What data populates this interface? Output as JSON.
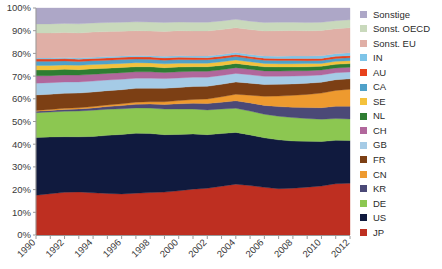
{
  "chart_data": {
    "type": "area",
    "stacked": true,
    "normalized": true,
    "title": "",
    "xlabel": "",
    "ylabel": "",
    "grid": false,
    "legend_position": "right",
    "ylim": [
      0,
      100
    ],
    "ytick_labels": [
      "0%",
      "10%",
      "20%",
      "30%",
      "40%",
      "50%",
      "60%",
      "70%",
      "80%",
      "90%",
      "100%"
    ],
    "ytick_values": [
      0,
      10,
      20,
      30,
      40,
      50,
      60,
      70,
      80,
      90,
      100
    ],
    "x": [
      1990,
      1991,
      1992,
      1993,
      1994,
      1995,
      1996,
      1997,
      1998,
      1999,
      2000,
      2001,
      2002,
      2003,
      2004,
      2005,
      2006,
      2007,
      2008,
      2009,
      2010,
      2011,
      2012
    ],
    "xtick_labels": [
      "1990",
      "1992",
      "1994",
      "1996",
      "1998",
      "2000",
      "2002",
      "2004",
      "2006",
      "2008",
      "2010",
      "2012"
    ],
    "xtick_values": [
      1990,
      1992,
      1994,
      1996,
      1998,
      2000,
      2002,
      2004,
      2006,
      2008,
      2010,
      2012
    ],
    "series": [
      {
        "name": "JP",
        "color": "#BE2F21",
        "values": [
          17.5,
          18.2,
          18.8,
          19.0,
          18.6,
          18.3,
          18.1,
          18.4,
          18.7,
          18.9,
          19.5,
          20.2,
          20.6,
          21.5,
          22.4,
          21.8,
          21.0,
          20.2,
          20.4,
          21.0,
          21.6,
          22.6,
          22.8
        ]
      },
      {
        "name": "US",
        "color": "#101A3E",
        "values": [
          25.4,
          25.0,
          24.5,
          24.3,
          24.8,
          25.6,
          26.2,
          26.4,
          26.0,
          25.3,
          24.8,
          24.3,
          23.6,
          23.2,
          22.8,
          22.3,
          21.8,
          21.3,
          20.6,
          20.1,
          19.6,
          19.1,
          18.8
        ]
      },
      {
        "name": "DE",
        "color": "#8CC751",
        "values": [
          11.0,
          11.0,
          11.2,
          11.4,
          11.6,
          11.5,
          11.3,
          11.2,
          11.2,
          11.3,
          11.2,
          11.0,
          10.9,
          10.8,
          10.6,
          10.5,
          10.4,
          10.3,
          10.2,
          10.0,
          9.8,
          9.6,
          9.5
        ]
      },
      {
        "name": "KR",
        "color": "#4B4977",
        "values": [
          0.6,
          0.7,
          0.8,
          0.9,
          1.0,
          1.2,
          1.4,
          1.6,
          1.8,
          2.0,
          2.3,
          2.5,
          2.8,
          3.0,
          3.3,
          3.6,
          3.9,
          4.2,
          4.5,
          4.8,
          5.1,
          5.4,
          5.6
        ]
      },
      {
        "name": "CN",
        "color": "#EE9A2F",
        "values": [
          0.4,
          0.4,
          0.5,
          0.5,
          0.6,
          0.7,
          0.8,
          0.9,
          1.0,
          1.2,
          1.4,
          1.7,
          2.0,
          2.4,
          2.9,
          3.4,
          4.0,
          4.6,
          5.2,
          5.8,
          6.4,
          7.0,
          7.5
        ]
      },
      {
        "name": "FR",
        "color": "#7C3F14",
        "values": [
          6.8,
          6.7,
          6.6,
          6.5,
          6.4,
          6.3,
          6.2,
          6.1,
          6.0,
          5.9,
          5.8,
          5.7,
          5.6,
          5.5,
          5.4,
          5.3,
          5.2,
          5.1,
          5.0,
          4.9,
          4.8,
          4.7,
          4.6
        ]
      },
      {
        "name": "GB",
        "color": "#A5CBE6",
        "values": [
          5.2,
          5.1,
          5.0,
          4.9,
          4.8,
          4.7,
          4.6,
          4.5,
          4.4,
          4.3,
          4.2,
          4.1,
          4.0,
          3.9,
          3.8,
          3.7,
          3.6,
          3.5,
          3.4,
          3.3,
          3.2,
          3.1,
          3.0
        ]
      },
      {
        "name": "CH",
        "color": "#B1679C",
        "values": [
          3.2,
          3.1,
          3.1,
          3.0,
          3.0,
          2.9,
          2.9,
          2.8,
          2.8,
          2.7,
          2.7,
          2.6,
          2.6,
          2.5,
          2.5,
          2.4,
          2.4,
          2.3,
          2.3,
          2.2,
          2.2,
          2.1,
          2.1
        ]
      },
      {
        "name": "NL",
        "color": "#2E7D32",
        "values": [
          2.6,
          2.5,
          2.5,
          2.4,
          2.4,
          2.3,
          2.3,
          2.2,
          2.2,
          2.1,
          2.1,
          2.0,
          2.0,
          1.9,
          1.9,
          1.8,
          1.8,
          1.8,
          1.7,
          1.7,
          1.6,
          1.6,
          1.6
        ]
      },
      {
        "name": "SE",
        "color": "#F4C23C",
        "values": [
          2.0,
          2.0,
          1.9,
          1.9,
          1.9,
          1.8,
          1.8,
          1.8,
          1.7,
          1.7,
          1.7,
          1.6,
          1.6,
          1.6,
          1.5,
          1.5,
          1.5,
          1.4,
          1.4,
          1.4,
          1.3,
          1.3,
          1.3
        ]
      },
      {
        "name": "CA",
        "color": "#4FA1C9",
        "values": [
          1.8,
          1.8,
          1.8,
          1.7,
          1.7,
          1.7,
          1.7,
          1.6,
          1.6,
          1.6,
          1.6,
          1.5,
          1.5,
          1.5,
          1.5,
          1.4,
          1.4,
          1.4,
          1.4,
          1.3,
          1.3,
          1.3,
          1.3
        ]
      },
      {
        "name": "AU",
        "color": "#E8411C",
        "values": [
          1.0,
          1.0,
          1.0,
          1.0,
          1.0,
          1.0,
          1.0,
          1.0,
          1.0,
          1.0,
          1.0,
          1.0,
          0.9,
          0.9,
          0.9,
          0.9,
          0.9,
          0.9,
          0.9,
          0.9,
          0.9,
          0.9,
          0.9
        ]
      },
      {
        "name": "IN",
        "color": "#7EC4E8",
        "values": [
          0.5,
          0.5,
          0.5,
          0.5,
          0.5,
          0.6,
          0.6,
          0.6,
          0.6,
          0.7,
          0.7,
          0.7,
          0.8,
          0.8,
          0.9,
          0.9,
          1.0,
          1.0,
          1.1,
          1.1,
          1.2,
          1.2,
          1.3
        ]
      },
      {
        "name": "Sonst. EU",
        "color": "#E0AFA6",
        "values": [
          11.0,
          11.0,
          11.0,
          11.1,
          11.1,
          11.0,
          10.9,
          10.9,
          10.9,
          11.0,
          11.0,
          11.0,
          11.0,
          11.0,
          10.9,
          11.0,
          11.0,
          11.1,
          11.1,
          11.1,
          11.1,
          11.0,
          11.0
        ]
      },
      {
        "name": "Sonst. OECD",
        "color": "#C9D9BC",
        "values": [
          4.0,
          4.0,
          4.0,
          4.0,
          4.0,
          4.0,
          3.9,
          3.9,
          3.9,
          3.9,
          3.8,
          3.8,
          3.8,
          3.8,
          3.7,
          3.7,
          3.7,
          3.7,
          3.6,
          3.6,
          3.6,
          3.5,
          3.5
        ]
      },
      {
        "name": "Sonstige",
        "color": "#ADA7C7",
        "values": [
          7.0,
          7.0,
          6.8,
          7.0,
          6.6,
          6.4,
          6.3,
          6.1,
          6.2,
          6.4,
          6.2,
          6.3,
          6.3,
          5.7,
          5.0,
          5.8,
          6.4,
          6.2,
          6.2,
          6.4,
          6.3,
          5.6,
          5.2
        ]
      }
    ]
  },
  "legend": {
    "items": [
      {
        "label": "Sonstige",
        "color": "#ADA7C7"
      },
      {
        "label": "Sonst. OECD",
        "color": "#C9D9BC"
      },
      {
        "label": "Sonst. EU",
        "color": "#E0AFA6"
      },
      {
        "label": "IN",
        "color": "#7EC4E8"
      },
      {
        "label": "AU",
        "color": "#E8411C"
      },
      {
        "label": "CA",
        "color": "#4FA1C9"
      },
      {
        "label": "SE",
        "color": "#F4C23C"
      },
      {
        "label": "NL",
        "color": "#2E7D32"
      },
      {
        "label": "CH",
        "color": "#B1679C"
      },
      {
        "label": "GB",
        "color": "#A5CBE6"
      },
      {
        "label": "FR",
        "color": "#7C3F14"
      },
      {
        "label": "CN",
        "color": "#EE9A2F"
      },
      {
        "label": "KR",
        "color": "#4B4977"
      },
      {
        "label": "DE",
        "color": "#8CC751"
      },
      {
        "label": "US",
        "color": "#101A3E"
      },
      {
        "label": "JP",
        "color": "#BE2F21"
      }
    ]
  },
  "axes": {
    "axis_color": "#9a9a9a"
  }
}
